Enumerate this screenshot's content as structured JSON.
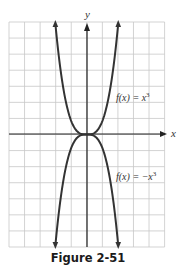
{
  "chart_data": {
    "type": "line",
    "title": "",
    "caption": "Figure 2-51",
    "xlabel": "x",
    "ylabel": "y",
    "grid": true,
    "xlim": [
      -5,
      5
    ],
    "ylim": [
      -7,
      7
    ],
    "series": [
      {
        "name": "f(x) = x^3",
        "label": "f(x) = x",
        "exponent": "3",
        "points": [
          [
            -2.0,
            7.0
          ],
          [
            -1.54,
            2.0
          ],
          [
            -1.15,
            1.0
          ],
          [
            0,
            0
          ],
          [
            1.15,
            1.0
          ],
          [
            1.54,
            2.0
          ],
          [
            2.0,
            7.0
          ]
        ]
      },
      {
        "name": "f(x) = -x^3",
        "label": "f(x) = −x",
        "exponent": "3",
        "points": [
          [
            -2.0,
            -7.0
          ],
          [
            -1.54,
            -2.0
          ],
          [
            -1.15,
            -1.0
          ],
          [
            0,
            0
          ],
          [
            1.15,
            -1.0
          ],
          [
            1.54,
            -2.0
          ],
          [
            2.0,
            -7.0
          ]
        ]
      }
    ],
    "annotations": [
      "f(x) = x^3",
      "f(x) = -x^3"
    ]
  },
  "figure": {
    "caption": "Figure 2-51",
    "x_axis_label": "x",
    "y_axis_label": "y",
    "upper_label": "f(x) = x",
    "upper_exp": "3",
    "lower_label": "f(x) = −x",
    "lower_exp": "3"
  },
  "colors": {
    "grid": "#c8c8c8",
    "axis": "#222222",
    "curve": "#333333"
  }
}
